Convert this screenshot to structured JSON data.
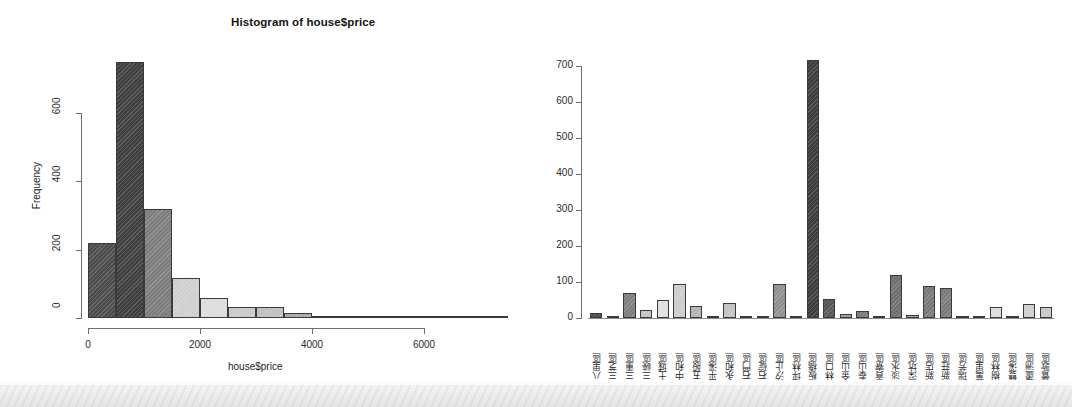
{
  "figure": {
    "background": "#ffffff",
    "scan_band_color": "#ebebeb"
  },
  "chart_data": [
    {
      "id": "histogram",
      "type": "bar",
      "title": "Histogram of house$price",
      "xlabel": "house$price",
      "ylabel": "Frequency",
      "xlim": [
        0,
        7500
      ],
      "ylim": [
        0,
        760
      ],
      "xticks": [
        0,
        2000,
        4000,
        6000
      ],
      "xtick_labels": [
        "0",
        "2000",
        "4000",
        "6000"
      ],
      "yticks": [
        0,
        200,
        400,
        600
      ],
      "ytick_labels": [
        "0",
        "200",
        "400",
        "600"
      ],
      "grid": false,
      "legend": "none",
      "bin_width": 500,
      "bin_edges": [
        0,
        500,
        1000,
        1500,
        2000,
        2500,
        3000,
        3500,
        4000,
        4500,
        5000,
        5500,
        6000,
        6500,
        7000,
        7500
      ],
      "categories": [
        "0-500",
        "500-1000",
        "1000-1500",
        "1500-2000",
        "2000-2500",
        "2500-3000",
        "3000-3500",
        "3500-4000",
        "4000-4500",
        "4500-5000",
        "5000-5500",
        "5500-6000",
        "6000-6500",
        "6500-7000",
        "7000-7500"
      ],
      "values": [
        218,
        748,
        318,
        116,
        58,
        33,
        33,
        14,
        3,
        2,
        2,
        1,
        0,
        0,
        7
      ],
      "bar_fills": [
        "#4c4c4c",
        "#3f3f3f",
        "#7d7d7d",
        "#cfcfcf",
        "#dcdcdc",
        "#c9c9c9",
        "#bfbfbf",
        "#a9a9a9",
        "#9d9d9d",
        "#9d9d9d",
        "#9d9d9d",
        "#9d9d9d",
        "#9d9d9d",
        "#9d9d9d",
        "#7a7a7a"
      ]
    },
    {
      "id": "districts",
      "type": "bar",
      "title": "",
      "xlabel": "",
      "ylabel": "",
      "ylim": [
        0,
        740
      ],
      "yticks": [
        0,
        100,
        200,
        300,
        400,
        500,
        600,
        700
      ],
      "ytick_labels": [
        "0",
        "100",
        "200",
        "300",
        "400",
        "500",
        "600",
        "700"
      ],
      "grid": false,
      "legend": "none",
      "categories": [
        "八里區",
        "三芝區",
        "三重區",
        "三峽區",
        "土城區",
        "中和區",
        "五股區",
        "平溪區",
        "永和區",
        "石門區",
        "石碇區",
        "汐止區",
        "坪林區",
        "板橋區",
        "林口區",
        "金山區",
        "泰山區",
        "貢寮區",
        "淡水區",
        "深坑區",
        "新店區",
        "新莊區",
        "瑞芳區",
        "萬里區",
        "樹林區",
        "雙溪區",
        "蘆洲區",
        "鶯歌區"
      ],
      "values": [
        14,
        6,
        70,
        23,
        50,
        95,
        34,
        1,
        42,
        3,
        4,
        94,
        2,
        718,
        53,
        11,
        19,
        3,
        121,
        7,
        88,
        83,
        2,
        5,
        30,
        1,
        39,
        32
      ],
      "bar_fills": [
        "#4f4f4f",
        "#8a8a8a",
        "#7e7e7e",
        "#c6c6c6",
        "#e0e0e0",
        "#cccccc",
        "#b4b4b4",
        "#a0a0a0",
        "#c2c2c2",
        "#a8a8a8",
        "#a8a8a8",
        "#909090",
        "#a8a8a8",
        "#3c3c3c",
        "#565656",
        "#9a9a9a",
        "#7c7c7c",
        "#a8a8a8",
        "#6f6f6f",
        "#a8a8a8",
        "#787878",
        "#7a7a7a",
        "#a8a8a8",
        "#a8a8a8",
        "#dcdcdc",
        "#a8a8a8",
        "#cfcfcf",
        "#c8c8c8"
      ]
    }
  ]
}
